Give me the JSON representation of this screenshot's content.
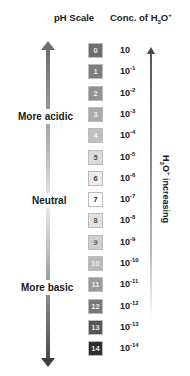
{
  "headers": {
    "ph_scale": "pH Scale",
    "conc_prefix": "Conc. of H",
    "conc_sub": "3",
    "conc_mid": "O",
    "conc_sup": "+"
  },
  "labels": {
    "acidic": "More acidic",
    "neutral": "Neutral",
    "basic": "More basic"
  },
  "vertical_label": {
    "prefix": "H",
    "sub": "3",
    "mid": "O",
    "sup": "+",
    "suffix": " increasing"
  },
  "scale": [
    {
      "ph": "0",
      "base": "10",
      "exp": "",
      "bg": "#6e6e6e",
      "fg": "#e8e8e8"
    },
    {
      "ph": "1",
      "base": "10",
      "exp": "-1",
      "bg": "#7d7d7d",
      "fg": "#e8e8e8"
    },
    {
      "ph": "2",
      "base": "10",
      "exp": "-2",
      "bg": "#929292",
      "fg": "#eeeeee"
    },
    {
      "ph": "3",
      "base": "10",
      "exp": "-3",
      "bg": "#a9a9a9",
      "fg": "#f0f0f0"
    },
    {
      "ph": "4",
      "base": "10",
      "exp": "-4",
      "bg": "#c0c0c0",
      "fg": "#f4f4f4"
    },
    {
      "ph": "5",
      "base": "10",
      "exp": "-5",
      "bg": "#dcdcdc",
      "fg": "#555555"
    },
    {
      "ph": "6",
      "base": "10",
      "exp": "-6",
      "bg": "#ececec",
      "fg": "#444444"
    },
    {
      "ph": "7",
      "base": "10",
      "exp": "-7",
      "bg": "#ffffff",
      "fg": "#222222"
    },
    {
      "ph": "8",
      "base": "10",
      "exp": "-8",
      "bg": "#e2e2e2",
      "fg": "#555555"
    },
    {
      "ph": "9",
      "base": "10",
      "exp": "-9",
      "bg": "#cfcfcf",
      "fg": "#666666"
    },
    {
      "ph": "10",
      "base": "10",
      "exp": "-10",
      "bg": "#b8b8b8",
      "fg": "#f0f0f0"
    },
    {
      "ph": "11",
      "base": "10",
      "exp": "-11",
      "bg": "#9a9a9a",
      "fg": "#eeeeee"
    },
    {
      "ph": "12",
      "base": "10",
      "exp": "-12",
      "bg": "#777777",
      "fg": "#eeeeee"
    },
    {
      "ph": "13",
      "base": "10",
      "exp": "-13",
      "bg": "#555555",
      "fg": "#e6e6e6"
    },
    {
      "ph": "14",
      "base": "10",
      "exp": "-14",
      "bg": "#2e2e2e",
      "fg": "#e6e6e6"
    }
  ]
}
